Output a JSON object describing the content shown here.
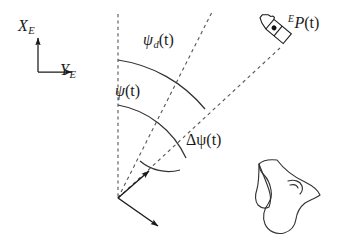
{
  "figure": {
    "background_color": "#ffffff",
    "line_color": "#1a1a1a",
    "width": 343,
    "height": 238
  },
  "earth_frame": {
    "x_axis_label": "X",
    "x_axis_subscript": "E",
    "y_axis_label": "Y",
    "y_axis_subscript": "E",
    "origin": {
      "x": 38,
      "y": 72
    }
  },
  "angles": [
    {
      "id": "psi_d",
      "symbol": "ψ",
      "subscript": "d",
      "argument": "(t)",
      "description": "desired heading angle",
      "label_position": {
        "x": 143,
        "y": 32
      }
    },
    {
      "id": "psi",
      "symbol": "ψ",
      "subscript": "",
      "argument": "(t)",
      "description": "actual heading angle",
      "label_position": {
        "x": 115,
        "y": 83
      }
    },
    {
      "id": "delta_psi",
      "symbol": "Δψ",
      "subscript": "",
      "argument": "(t)",
      "description": "heading error angle",
      "label_position": {
        "x": 186,
        "y": 132
      }
    }
  ],
  "target_point": {
    "superscript": "E",
    "symbol": "P",
    "argument": "(t)",
    "description": "target position in Earth frame",
    "label_position": {
      "x": 288,
      "y": 14
    }
  },
  "vehicle_origin": {
    "x": 118,
    "y": 198
  },
  "reference_line": {
    "description": "vertical north reference, dashed",
    "x": 118,
    "y_top": 14,
    "y_bottom": 198,
    "style": "dashed"
  },
  "rays": [
    {
      "id": "desired-heading-ray",
      "description": "dashed ray along desired heading psi_d",
      "from": {
        "x": 118,
        "y": 198
      },
      "to": {
        "x": 210,
        "y": 14
      },
      "style": "dashed"
    },
    {
      "id": "line-of-sight-ray",
      "description": "dashed ray from vehicle to target point P(t)",
      "from": {
        "x": 118,
        "y": 198
      },
      "to": {
        "x": 276,
        "y": 52
      },
      "style": "dashed"
    }
  ],
  "body_axes": [
    {
      "id": "body-x-axis",
      "description": "body surge axis arrow",
      "from": {
        "x": 118,
        "y": 198
      },
      "to": {
        "x": 148,
        "y": 172
      }
    },
    {
      "id": "body-y-axis",
      "description": "body sway axis arrow",
      "from": {
        "x": 118,
        "y": 198
      },
      "to": {
        "x": 158,
        "y": 225
      }
    }
  ],
  "vessels": [
    {
      "id": "target-vessel",
      "description": "small tilted ship outline at target point with position dot",
      "position": {
        "x": 276,
        "y": 30
      }
    },
    {
      "id": "sketch-vessel",
      "description": "hand drawn vessel hull sketch at lower right",
      "position": {
        "x": 290,
        "y": 190
      }
    }
  ]
}
